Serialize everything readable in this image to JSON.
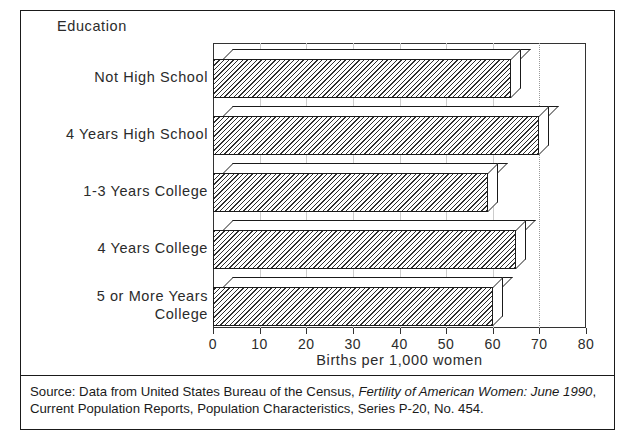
{
  "chart_data": {
    "type": "bar",
    "orientation": "horizontal",
    "title": "",
    "group_title": "Education",
    "categories": [
      "Not High School",
      "4 Years High School",
      "1-3 Years College",
      "4 Years College",
      "5 or More Years College"
    ],
    "category_display": [
      "Not High School",
      "4 Years High School",
      "1-3 Years College",
      "4 Years College",
      "5 or More Years\nCollege"
    ],
    "values": [
      64,
      70,
      59,
      65,
      60
    ],
    "xlabel": "Births per 1,000 women",
    "ylabel": "Education",
    "xlim": [
      0,
      80
    ],
    "xticks": [
      0,
      10,
      20,
      30,
      40,
      50,
      60,
      70,
      80
    ],
    "xtick_labels": [
      "0",
      "10",
      "20",
      "30",
      "40",
      "50",
      "60",
      "70",
      "80"
    ],
    "grid": true,
    "gridline_accent": 70,
    "legend": "none",
    "style": "3d-hatched-bars"
  },
  "group_label": "Education",
  "axis": {
    "x_title": "Births per 1,000 women",
    "tick_labels": [
      "0",
      "10",
      "20",
      "30",
      "40",
      "50",
      "60",
      "70",
      "80"
    ]
  },
  "bars": [
    {
      "label": "Not High School",
      "value": 64,
      "label_lines": [
        "Not High School"
      ]
    },
    {
      "label": "4 Years High School",
      "value": 70,
      "label_lines": [
        "4 Years High School"
      ]
    },
    {
      "label": "1-3 Years College",
      "value": 59,
      "label_lines": [
        "1-3 Years College"
      ]
    },
    {
      "label": "4 Years College",
      "value": 65,
      "label_lines": [
        "4 Years College"
      ]
    },
    {
      "label": "5 or More Years College",
      "value": 60,
      "label_lines": [
        "5 or More Years",
        "College"
      ]
    }
  ],
  "source": {
    "line1_a": "Source: Data from United States Bureau of the Census, ",
    "line1_italic": "Fertility of American Women: June 1990",
    "line1_b": ",",
    "line2": "Current Population Reports, Population Characteristics, Series P-20, No. 454."
  },
  "colors": {
    "ink": "#1a1a1a",
    "hatch": "#303030",
    "grid": "#cccccc",
    "accent_grid": "#9a9a9a",
    "background": "#ffffff"
  }
}
